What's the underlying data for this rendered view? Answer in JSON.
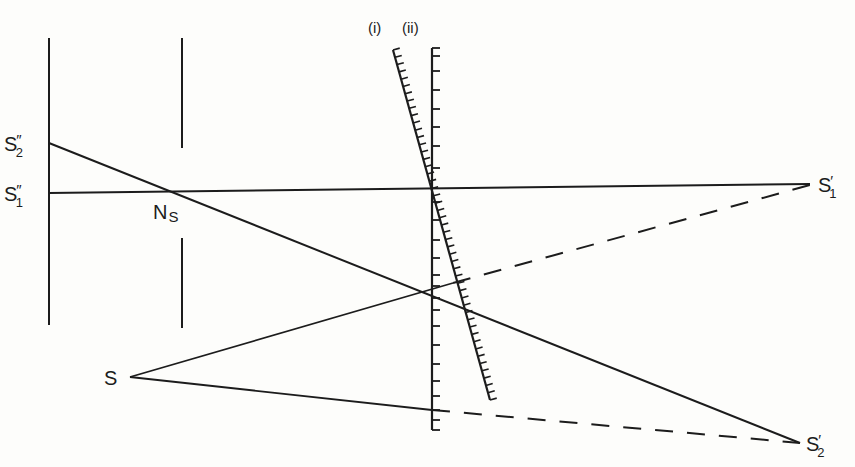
{
  "diagram": {
    "type": "optical ray diagram",
    "labels": {
      "scale_i": "(i)",
      "scale_ii": "(ii)",
      "s2_dd": {
        "base": "S",
        "sup": "″",
        "sub": "2"
      },
      "s1_dd": {
        "base": "S",
        "sup": "″",
        "sub": "1"
      },
      "ns": {
        "base": "N",
        "sub": "S"
      },
      "s": "S",
      "s1_p": {
        "base": "S",
        "sup": "′",
        "sub": "1"
      },
      "s2_p": {
        "base": "S",
        "sup": "′",
        "sub": "2"
      }
    },
    "colors": {
      "ink": "#1c1c1c",
      "background": "#fdfdfb"
    }
  }
}
